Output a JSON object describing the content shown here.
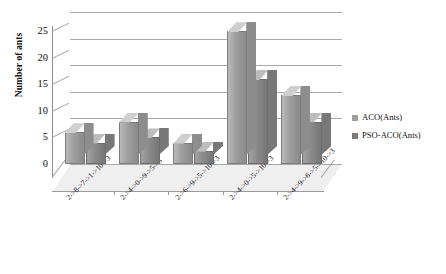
{
  "chart_data": {
    "type": "bar",
    "title": "",
    "xlabel": "",
    "ylabel": "Number of ants",
    "ylim": [
      0,
      26
    ],
    "yticks": [
      0,
      5,
      10,
      15,
      20,
      25
    ],
    "grid": true,
    "legend_position": "right",
    "style": "3d-clustered-column-grayscale",
    "categories": [
      "2->8->7->1->10->3",
      "2->4->0->9->5->3",
      "2->6->9->5->10->3",
      "2->4->0->5->10->3",
      "2->4->9->6->5->10->3"
    ],
    "series": [
      {
        "name": "ACO(Ants)",
        "color": "#9d9d9d",
        "values": [
          6,
          8,
          4,
          25,
          13
        ]
      },
      {
        "name": "PSO-ACO(Ants)",
        "color": "#7c7c7c",
        "values": [
          4,
          5,
          2.5,
          16,
          8
        ]
      }
    ]
  },
  "axis": {
    "y_title": "Number of ants",
    "y_tick_labels": [
      "0",
      "5",
      "10",
      "15",
      "20",
      "25"
    ]
  },
  "legend": {
    "items": [
      {
        "label": "ACO(Ants)"
      },
      {
        "label": "PSO-ACO(Ants)"
      }
    ]
  }
}
